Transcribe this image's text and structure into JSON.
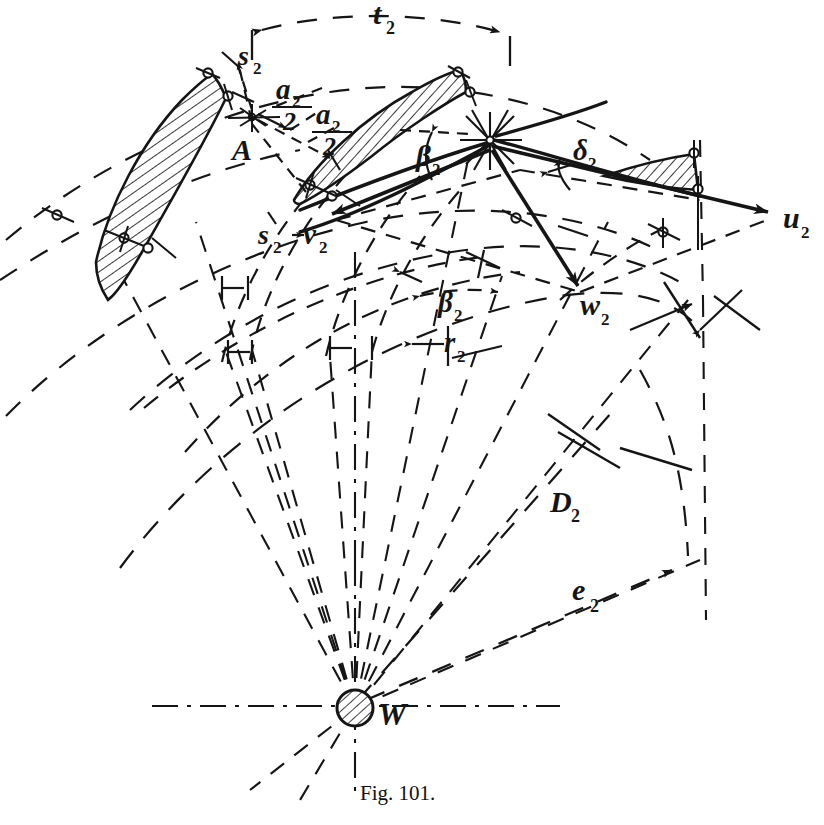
{
  "figure": {
    "caption": "Fig. 101.",
    "ink_color": "#151515",
    "background_color": "#ffffff",
    "width": 824,
    "height": 825
  },
  "labels": {
    "pitch": {
      "text": "t",
      "sub": "2"
    },
    "blade_thickness_top": {
      "text": "s",
      "sub": "2"
    },
    "blade_thickness_lower": {
      "text": "s",
      "sub": "2"
    },
    "half_angle_upper": {
      "num": "a",
      "num_sub": "2",
      "den": "2"
    },
    "half_angle_lower": {
      "num": "a",
      "num_sub": "2",
      "den": "2"
    },
    "point_a": {
      "text": "A",
      "sub": ""
    },
    "beta_blade": {
      "text": "β",
      "sub": "2"
    },
    "beta_flow": {
      "text": "β",
      "sub": "2"
    },
    "delta": {
      "text": "δ",
      "sub": "2"
    },
    "u_velocity": {
      "text": "u",
      "sub": "2"
    },
    "v_velocity": {
      "text": "v",
      "sub": "2"
    },
    "w_velocity": {
      "text": "w",
      "sub": "2"
    },
    "radius": {
      "text": "r",
      "sub": "2"
    },
    "diameter": {
      "text": "D",
      "sub": "2"
    },
    "eccentricity": {
      "text": "e",
      "sub": "2"
    },
    "hub_center": {
      "text": "W",
      "sub": ""
    }
  },
  "geometry": {
    "hub_center": {
      "x": 355,
      "y": 708,
      "r": 18
    },
    "apex_node": {
      "x": 490,
      "y": 140
    },
    "u_arrow_tip": {
      "x": 775,
      "y": 214
    },
    "w_arrow_tip": {
      "x": 585,
      "y": 292
    },
    "v_arrow_tip": {
      "x": 322,
      "y": 218
    },
    "e_arrow_tip": {
      "x": 678,
      "y": 568
    },
    "d_arrow_tip": {
      "x": 690,
      "y": 307
    }
  }
}
